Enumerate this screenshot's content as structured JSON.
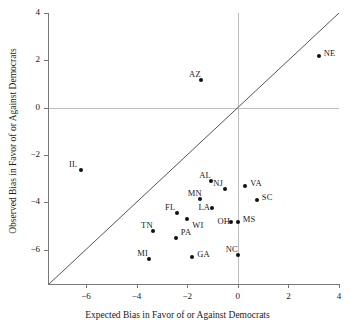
{
  "chart_data": {
    "type": "scatter",
    "title": "",
    "xlabel": "Expected Bias in Favor of or Against Democrats",
    "ylabel": "Observed Bias in Favor of or Against Democrats",
    "xlim": [
      -7.5,
      4
    ],
    "ylim": [
      -7.5,
      4
    ],
    "xticks": [
      -6,
      -4,
      -2,
      0,
      2,
      4
    ],
    "yticks": [
      -6,
      -4,
      -2,
      0,
      2,
      4
    ],
    "xtick_labels": [
      "−6",
      "−4",
      "−2",
      "0",
      "2",
      "4"
    ],
    "ytick_labels": [
      "−6",
      "−4",
      "−2",
      "0",
      "2",
      "4"
    ],
    "grid": false,
    "legend": null,
    "reference_lines": [
      {
        "name": "identity-line",
        "type": "diagonal",
        "slope": 1,
        "intercept": 0,
        "color": "#555555"
      },
      {
        "name": "zero-horizontal",
        "type": "hline",
        "value": 0,
        "color": "#bdbdbd"
      },
      {
        "name": "zero-vertical",
        "type": "vline",
        "value": 0,
        "color": "#bdbdbd"
      }
    ],
    "point_color": "#111111",
    "labels": [
      "NE",
      "AZ",
      "IL",
      "AL",
      "VA",
      "NJ",
      "SC",
      "MN",
      "LA",
      "FL",
      "WI",
      "MS",
      "OH",
      "TN",
      "PA",
      "MI",
      "GA",
      "NC"
    ],
    "points": [
      {
        "label": "NE",
        "x": 3.2,
        "y": 2.2,
        "label_pos": "right"
      },
      {
        "label": "AZ",
        "x": -1.45,
        "y": 1.15,
        "label_pos": "upleft"
      },
      {
        "label": "IL",
        "x": -6.2,
        "y": -2.65,
        "label_pos": "upleft"
      },
      {
        "label": "AL",
        "x": -1.05,
        "y": -3.1,
        "label_pos": "upleft"
      },
      {
        "label": "VA",
        "x": 0.3,
        "y": -3.3,
        "label_pos": "right"
      },
      {
        "label": "NJ",
        "x": -0.5,
        "y": -3.45,
        "label_pos": "upleft"
      },
      {
        "label": "SC",
        "x": 0.75,
        "y": -3.9,
        "label_pos": "right"
      },
      {
        "label": "MN",
        "x": -1.5,
        "y": -3.85,
        "label_pos": "upleft"
      },
      {
        "label": "LA",
        "x": -1.0,
        "y": -4.25,
        "label_pos": "left"
      },
      {
        "label": "FL",
        "x": -2.4,
        "y": -4.45,
        "label_pos": "upleft"
      },
      {
        "label": "WI",
        "x": -2.0,
        "y": -4.7,
        "label_pos": "downright"
      },
      {
        "label": "MS",
        "x": 0.0,
        "y": -4.85,
        "label_pos": "right"
      },
      {
        "label": "OH",
        "x": -0.25,
        "y": -4.85,
        "label_pos": "left"
      },
      {
        "label": "TN",
        "x": -3.35,
        "y": -5.2,
        "label_pos": "upleft"
      },
      {
        "label": "PA",
        "x": -2.45,
        "y": -5.5,
        "label_pos": "upright"
      },
      {
        "label": "MI",
        "x": -3.5,
        "y": -6.4,
        "label_pos": "upleft"
      },
      {
        "label": "GA",
        "x": -1.8,
        "y": -6.3,
        "label_pos": "right"
      },
      {
        "label": "NC",
        "x": 0.0,
        "y": -6.25,
        "label_pos": "upleft"
      }
    ]
  }
}
